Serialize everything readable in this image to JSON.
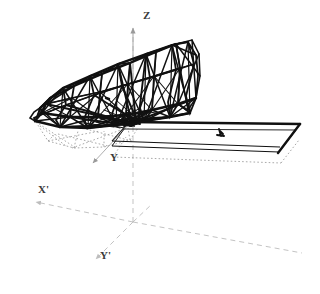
{
  "figure": {
    "name": "3d-space-frame-truss-wireframe",
    "background_color": "#ffffff",
    "line_color": "#111111",
    "hidden_line_color": "#8d8d8d",
    "axis_color": "#b9b9b9",
    "label_color": "#3a3a3a"
  },
  "axes": {
    "labels": [
      {
        "id": "z",
        "text": "Z",
        "x": 143,
        "y": 16,
        "arrow": "up"
      },
      {
        "id": "y",
        "text": "Y",
        "x": 110,
        "y": 158,
        "arrow": "down-left"
      },
      {
        "id": "x-prime",
        "text": "X'",
        "x": 38,
        "y": 190,
        "arrow": "left"
      },
      {
        "id": "y-prime",
        "text": "Y'",
        "x": 100,
        "y": 256,
        "arrow": "down-left"
      }
    ],
    "origin": {
      "x": 133,
      "y": 222
    },
    "z_axis_top": {
      "x": 133,
      "y": 26
    },
    "x_prime_end": {
      "x": 30,
      "y": 204
    },
    "y_prime_end": {
      "x": 92,
      "y": 262
    },
    "ground_right_end": {
      "x": 300,
      "y": 253
    }
  },
  "geometry": {
    "truss": {
      "name": "space-frame-truss",
      "nodes": [
        [
          41,
          109
        ],
        [
          34,
          122
        ],
        [
          56,
          133
        ],
        [
          76,
          129
        ],
        [
          96,
          118
        ],
        [
          93,
          100
        ],
        [
          71,
          92
        ],
        [
          50,
          97
        ],
        [
          84,
          79
        ],
        [
          108,
          70
        ],
        [
          132,
          60
        ],
        [
          155,
          52
        ],
        [
          176,
          46
        ],
        [
          192,
          41
        ],
        [
          62,
          88
        ],
        [
          80,
          74
        ],
        [
          104,
          64
        ],
        [
          128,
          55
        ],
        [
          150,
          48
        ],
        [
          172,
          40
        ],
        [
          100,
          131
        ],
        [
          124,
          128
        ],
        [
          148,
          124
        ],
        [
          168,
          120
        ],
        [
          186,
          116
        ],
        [
          110,
          104
        ],
        [
          134,
          98
        ],
        [
          158,
          92
        ],
        [
          178,
          86
        ],
        [
          196,
          78
        ],
        [
          152,
          36
        ],
        [
          176,
          32
        ],
        [
          190,
          52
        ],
        [
          196,
          70
        ],
        [
          186,
          96
        ],
        [
          166,
          114
        ],
        [
          148,
          120
        ],
        [
          126,
          112
        ],
        [
          116,
          88
        ],
        [
          140,
          80
        ],
        [
          162,
          72
        ],
        [
          180,
          66
        ]
      ]
    },
    "plate": {
      "name": "flat-plate-ramp",
      "corners": [
        [
          128,
          126
        ],
        [
          301,
          125
        ],
        [
          280,
          161
        ],
        [
          113,
          163
        ]
      ],
      "marker": {
        "x": 220,
        "y": 133
      }
    }
  }
}
